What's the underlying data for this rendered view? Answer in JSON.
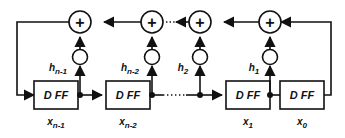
{
  "diagram": {
    "stroke_color": "#111111",
    "background_color": "#ffffff",
    "adder_symbol": "+",
    "register_label": "D FF",
    "ellipsis_symbol": "dotted-ellipsis",
    "stages": [
      {
        "id": "stage-n-1",
        "register_label": "D FF",
        "state_label_base": "x",
        "state_label_sub": "n-1",
        "coeff_label_base": "h",
        "coeff_label_sub": "n-1",
        "adder_symbol": "+"
      },
      {
        "id": "stage-n-2",
        "register_label": "D FF",
        "state_label_base": "x",
        "state_label_sub": "n-2",
        "coeff_label_base": "h",
        "coeff_label_sub": "n-2",
        "adder_symbol": "+"
      },
      {
        "id": "stage-1",
        "register_label": "D FF",
        "state_label_base": "x",
        "state_label_sub": "1",
        "coeff_label_base": "h",
        "coeff_label_sub": "2",
        "adder_symbol": "+"
      },
      {
        "id": "stage-0",
        "register_label": "D FF",
        "state_label_base": "x",
        "state_label_sub": "0",
        "coeff_label_base": "h",
        "coeff_label_sub": "1",
        "adder_symbol": "+"
      }
    ]
  }
}
